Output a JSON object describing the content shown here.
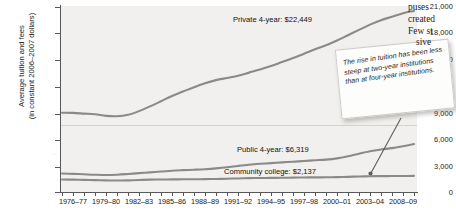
{
  "chart_data": {
    "type": "line",
    "title": "",
    "xlabel": "",
    "ylabel_line1": "Average tuition and fees",
    "ylabel_line2": "(in constant 2006–2007 dollars)",
    "ylim": [
      0,
      21000
    ],
    "yticks": [
      0,
      3000,
      6000,
      9000,
      12000,
      15000,
      18000,
      21000
    ],
    "ytick_labels": [
      "0",
      "3,000",
      "6,000",
      "9,000",
      "12,000",
      "15,000",
      "18,000",
      "21,000"
    ],
    "grid": false,
    "legend_position": "inline-annotations",
    "x": [
      "1976-77",
      "1977-78",
      "1978-79",
      "1979-80",
      "1980-81",
      "1981-82",
      "1982-83",
      "1983-84",
      "1984-85",
      "1985-86",
      "1986-87",
      "1987-88",
      "1988-89",
      "1989-90",
      "1990-91",
      "1991-92",
      "1992-93",
      "1993-94",
      "1994-95",
      "1995-96",
      "1996-97",
      "1997-98",
      "1998-99",
      "1999-00",
      "2000-01",
      "2001-02",
      "2002-03",
      "2003-04",
      "2004-05",
      "2005-06",
      "2006-07",
      "2007-08",
      "2008-09"
    ],
    "xtick_labels": [
      "1976–77",
      "1979–80",
      "1982–83",
      "1985–86",
      "1988–89",
      "1991–92",
      "1994–95",
      "1997–98",
      "2000–01",
      "2003–04",
      "2008–09"
    ],
    "series": [
      {
        "name": "Private 4-year",
        "end_label": "Private 4-year: $22,449",
        "end_value": 22449,
        "color": "#8b8a88",
        "values": [
          9000,
          8980,
          8900,
          8820,
          8640,
          8600,
          8760,
          9180,
          9720,
          10300,
          10900,
          11400,
          11900,
          12350,
          12700,
          12950,
          13200,
          13550,
          13900,
          14300,
          14750,
          15200,
          15700,
          16200,
          16650,
          17200,
          17800,
          18400,
          19000,
          19500,
          19900,
          20300,
          20560
        ]
      },
      {
        "name": "Public 4-year",
        "end_label": "Public 4-year: $6,319",
        "end_value": 6319,
        "color": "#8b8a88",
        "values": [
          2100,
          2060,
          2010,
          1960,
          1930,
          1960,
          2040,
          2140,
          2230,
          2320,
          2420,
          2480,
          2530,
          2590,
          2680,
          2800,
          2960,
          3100,
          3200,
          3280,
          3360,
          3440,
          3520,
          3600,
          3680,
          3820,
          4050,
          4350,
          4620,
          4820,
          4980,
          5200,
          5440
        ]
      },
      {
        "name": "Community college",
        "end_label": "Community college: $2,137",
        "end_value": 2137,
        "color": "#8b8a88",
        "values": [
          1420,
          1400,
          1380,
          1350,
          1320,
          1300,
          1320,
          1360,
          1400,
          1420,
          1430,
          1440,
          1450,
          1460,
          1480,
          1510,
          1540,
          1570,
          1590,
          1600,
          1610,
          1630,
          1650,
          1660,
          1670,
          1690,
          1720,
          1760,
          1790,
          1800,
          1810,
          1820,
          1830
        ]
      }
    ],
    "annotation": {
      "text": "The rise in tuition has been less steep at two-year institutions than at four-year institutions.",
      "points_to": "Community college"
    }
  },
  "page_text": {
    "fragments": [
      "puses",
      "created",
      "Few st",
      "sive"
    ]
  },
  "colors": {
    "plot_background": "#f1f0ee",
    "axis": "#58575a",
    "line": "#8b8a88",
    "text": "#1b1b1b",
    "callout_background": "#fdfdfc",
    "callout_border": "#cfcdc8"
  }
}
